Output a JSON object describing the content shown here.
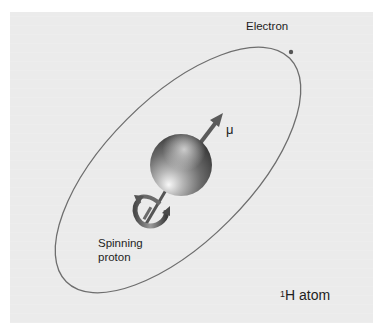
{
  "diagram": {
    "labels": {
      "electron": "Electron",
      "magnetic_moment": "μ",
      "proton_line1": "Spinning",
      "proton_line2": "proton",
      "atom_superscript": "1",
      "atom_symbol": "H atom"
    },
    "elements": {
      "orbit": "elliptical electron orbit",
      "electron": "electron dot on orbit",
      "proton": "shaded sphere",
      "moment_arrow": "magnetic moment vector μ",
      "spin_arrow": "curved rotation arrow around spin axis"
    },
    "colors": {
      "background": "#ffffff",
      "panel": "#ebebeb",
      "orbit": "#6e6e6e",
      "arrow": "#5a5a5a",
      "text": "#1e1e1e"
    }
  }
}
